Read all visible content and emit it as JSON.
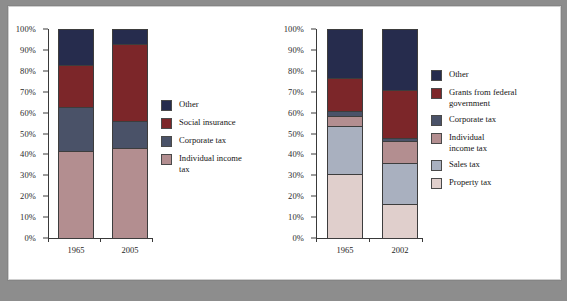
{
  "chart_data": [
    {
      "id": "federal",
      "type": "bar",
      "stacked": true,
      "title": "",
      "xlabel": "",
      "ylabel": "",
      "ylim": [
        0,
        100
      ],
      "grid": false,
      "legend_position": "right",
      "categories": [
        "1965",
        "2005"
      ],
      "ticks": [
        "0%",
        "10%",
        "20%",
        "30%",
        "40%",
        "50%",
        "60%",
        "70%",
        "80%",
        "90%",
        "100%"
      ],
      "tick_values": [
        0,
        10,
        20,
        30,
        40,
        50,
        60,
        70,
        80,
        90,
        100
      ],
      "series": [
        {
          "name": "Other",
          "color": "#262c4d",
          "values": [
            17.0,
            7.0
          ]
        },
        {
          "name": "Social insurance",
          "color": "#7c2629",
          "values": [
            20.5,
            37.0
          ]
        },
        {
          "name": "Corporate tax",
          "color": "#4a5268",
          "values": [
            21.0,
            13.0
          ]
        },
        {
          "name": "Individual income\ntax",
          "color": "#b38e90",
          "values": [
            41.5,
            43.0
          ]
        }
      ]
    },
    {
      "id": "state-local",
      "type": "bar",
      "stacked": true,
      "title": "",
      "xlabel": "",
      "ylabel": "",
      "ylim": [
        0,
        100
      ],
      "grid": false,
      "legend_position": "right",
      "categories": [
        "1965",
        "2002"
      ],
      "ticks": [
        "0%",
        "10%",
        "20%",
        "30%",
        "40%",
        "50%",
        "60%",
        "70%",
        "80%",
        "90%",
        "100%"
      ],
      "tick_values": [
        0,
        10,
        20,
        30,
        40,
        50,
        60,
        70,
        80,
        90,
        100
      ],
      "series": [
        {
          "name": "Other",
          "color": "#262c4d",
          "values": [
            23.5,
            29.0
          ]
        },
        {
          "name": "Grants from federal\ngovernment",
          "color": "#7c2629",
          "values": [
            15.5,
            23.0
          ]
        },
        {
          "name": "Corporate tax",
          "color": "#4a5268",
          "values": [
            2.5,
            1.5
          ]
        },
        {
          "name": "Individual\nincome tax",
          "color": "#b38e90",
          "values": [
            5.0,
            10.5
          ]
        },
        {
          "name": "Sales tax",
          "color": "#a9b0bf",
          "values": [
            23.0,
            19.5
          ]
        },
        {
          "name": "Property tax",
          "color": "#e0cfcc",
          "values": [
            30.5,
            16.5
          ]
        }
      ]
    }
  ],
  "figure": {
    "background": "#ffffff",
    "page_background": "#8d8d8d",
    "axis_color": "#3a3a3a"
  }
}
